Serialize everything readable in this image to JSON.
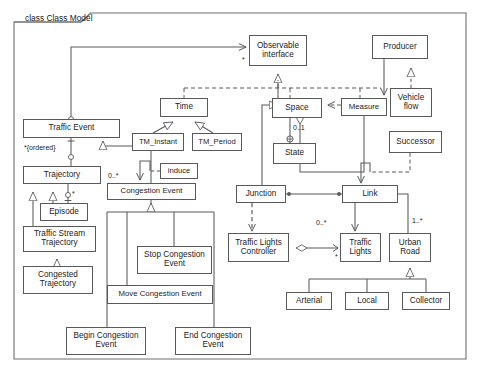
{
  "diagram": {
    "kind": "uml-class-diagram",
    "frame_label": "class Class Model",
    "canvas": {
      "width": 481,
      "height": 378
    },
    "colors": {
      "line": "#58595b",
      "text": "#1b1b1b",
      "background": "#ffffff"
    }
  },
  "classes": [
    {
      "id": "observable_interface",
      "label": "Observable\ninterface",
      "x": 249,
      "y": 35,
      "w": 58,
      "h": 31
    },
    {
      "id": "producer",
      "label": "Producer",
      "x": 372,
      "y": 35,
      "w": 56,
      "h": 24
    },
    {
      "id": "time",
      "label": "Time",
      "x": 160,
      "y": 98,
      "w": 48,
      "h": 19
    },
    {
      "id": "space",
      "label": "Space",
      "x": 272,
      "y": 98,
      "w": 50,
      "h": 20
    },
    {
      "id": "measure",
      "label": "Measure",
      "x": 341,
      "y": 98,
      "w": 46,
      "h": 18
    },
    {
      "id": "vehicle_flow",
      "label": "Vehicle\nflow",
      "x": 390,
      "y": 88,
      "w": 42,
      "h": 29
    },
    {
      "id": "traffic_event",
      "label": "Traffic Event",
      "x": 23,
      "y": 119,
      "w": 97,
      "h": 19
    },
    {
      "id": "tm_instant",
      "label": "TM_Instant",
      "x": 132,
      "y": 133,
      "w": 52,
      "h": 18
    },
    {
      "id": "tm_period",
      "label": "TM_Period",
      "x": 192,
      "y": 133,
      "w": 50,
      "h": 18
    },
    {
      "id": "successor",
      "label": "Successor",
      "x": 389,
      "y": 131,
      "w": 53,
      "h": 22
    },
    {
      "id": "state",
      "label": "State",
      "x": 273,
      "y": 143,
      "w": 43,
      "h": 21
    },
    {
      "id": "induce",
      "label": "induce",
      "x": 160,
      "y": 163,
      "w": 38,
      "h": 16
    },
    {
      "id": "trajectory",
      "label": "Trajectory",
      "x": 23,
      "y": 166,
      "w": 78,
      "h": 18
    },
    {
      "id": "congestion_event",
      "label": "Congestion Event",
      "x": 107,
      "y": 183,
      "w": 89,
      "h": 17
    },
    {
      "id": "junction",
      "label": "Junction",
      "x": 236,
      "y": 185,
      "w": 50,
      "h": 18
    },
    {
      "id": "link",
      "label": "Link",
      "x": 342,
      "y": 185,
      "w": 56,
      "h": 18
    },
    {
      "id": "episode",
      "label": "Episode",
      "x": 40,
      "y": 203,
      "w": 48,
      "h": 18
    },
    {
      "id": "traffic_stream_traj",
      "label": "Traffic Stream\nTrajectory",
      "x": 23,
      "y": 226,
      "w": 73,
      "h": 26
    },
    {
      "id": "traffic_lights_ctrl",
      "label": "Traffic Lights\nController",
      "x": 228,
      "y": 233,
      "w": 61,
      "h": 29
    },
    {
      "id": "traffic_lights",
      "label": "Traffic\nLights",
      "x": 340,
      "y": 233,
      "w": 41,
      "h": 29
    },
    {
      "id": "urban_road",
      "label": "Urban\nRoad",
      "x": 389,
      "y": 233,
      "w": 42,
      "h": 29
    },
    {
      "id": "stop_congestion",
      "label": "Stop Congestion\nEvent",
      "x": 137,
      "y": 246,
      "w": 75,
      "h": 28
    },
    {
      "id": "congested_traj",
      "label": "Congested\nTrajectory",
      "x": 23,
      "y": 266,
      "w": 70,
      "h": 28
    },
    {
      "id": "move_congestion",
      "label": "Move Congestion Event",
      "x": 107,
      "y": 285,
      "w": 106,
      "h": 19
    },
    {
      "id": "arterial",
      "label": "Arterial",
      "x": 286,
      "y": 292,
      "w": 46,
      "h": 18
    },
    {
      "id": "local",
      "label": "Local",
      "x": 345,
      "y": 292,
      "w": 44,
      "h": 18
    },
    {
      "id": "collector",
      "label": "Collector",
      "x": 402,
      "y": 292,
      "w": 48,
      "h": 18
    },
    {
      "id": "begin_congestion",
      "label": "Begin Congestion\nEvent",
      "x": 66,
      "y": 327,
      "w": 80,
      "h": 28
    },
    {
      "id": "end_congestion",
      "label": "End Congestion\nEvent",
      "x": 175,
      "y": 327,
      "w": 76,
      "h": 28
    }
  ],
  "multiplicities": [
    {
      "id": "m_observable_star",
      "label": "*",
      "x": 242,
      "y": 56
    },
    {
      "id": "m_state_01",
      "label": "0..1",
      "x": 291,
      "y": 125
    },
    {
      "id": "m_ordered",
      "label": "*{ordered}",
      "x": 24,
      "y": 145
    },
    {
      "id": "m_congestion_0n",
      "label": "0..*",
      "x": 108,
      "y": 173
    },
    {
      "id": "m_episode_star",
      "label": "*",
      "x": 66,
      "y": 192
    },
    {
      "id": "m_traffic_lights",
      "label": "0..*",
      "x": 316,
      "y": 220
    },
    {
      "id": "m_urban_road",
      "label": "1..*",
      "x": 412,
      "y": 218
    },
    {
      "id": "m_tlc_star",
      "label": "*",
      "x": 335,
      "y": 256
    }
  ],
  "relationships": [
    {
      "from": "traffic_event",
      "to": "observable_interface",
      "type": "association-directed"
    },
    {
      "from": "space",
      "to": "observable_interface",
      "type": "generalization"
    },
    {
      "from": "time",
      "to": "observable_interface",
      "type": "dependency"
    },
    {
      "from": "measure",
      "to": "observable_interface",
      "type": "dependency"
    },
    {
      "from": "tm_instant",
      "to": "time",
      "type": "generalization"
    },
    {
      "from": "tm_period",
      "to": "time",
      "type": "generalization"
    },
    {
      "from": "measure",
      "to": "space",
      "type": "dependency"
    },
    {
      "from": "producer",
      "to": "measure",
      "type": "association-directed"
    },
    {
      "from": "vehicle_flow",
      "to": "producer",
      "type": "realization"
    },
    {
      "from": "space",
      "to": "state",
      "type": "composition"
    },
    {
      "from": "measure",
      "to": "space",
      "type": "aggregation"
    },
    {
      "from": "successor",
      "to": "link",
      "type": "dependency"
    },
    {
      "from": "trajectory",
      "to": "traffic_event",
      "type": "aggregation"
    },
    {
      "from": "congestion_event",
      "to": "traffic_event",
      "type": "generalization"
    },
    {
      "from": "episode",
      "to": "trajectory",
      "type": "aggregation"
    },
    {
      "from": "traffic_stream_traj",
      "to": "trajectory",
      "type": "generalization"
    },
    {
      "from": "episode",
      "to": "trajectory",
      "type": "generalization"
    },
    {
      "from": "congested_traj",
      "to": "traffic_stream_traj",
      "type": "generalization"
    },
    {
      "from": "induce",
      "to": "congestion_event",
      "type": "dependency"
    },
    {
      "from": "stop_congestion",
      "to": "congestion_event",
      "type": "generalization"
    },
    {
      "from": "move_congestion",
      "to": "congestion_event",
      "type": "generalization"
    },
    {
      "from": "begin_congestion",
      "to": "congestion_event",
      "type": "generalization"
    },
    {
      "from": "end_congestion",
      "to": "congestion_event",
      "type": "generalization"
    },
    {
      "from": "junction",
      "to": "space",
      "type": "generalization"
    },
    {
      "from": "junction",
      "to": "link",
      "type": "association"
    },
    {
      "from": "junction",
      "to": "traffic_lights_ctrl",
      "type": "dependency"
    },
    {
      "from": "link",
      "to": "traffic_lights",
      "type": "association-directed"
    },
    {
      "from": "link",
      "to": "urban_road",
      "type": "association"
    },
    {
      "from": "traffic_lights_ctrl",
      "to": "traffic_lights",
      "type": "aggregation"
    },
    {
      "from": "arterial",
      "to": "urban_road",
      "type": "generalization"
    },
    {
      "from": "local",
      "to": "urban_road",
      "type": "generalization"
    },
    {
      "from": "collector",
      "to": "urban_road",
      "type": "generalization"
    }
  ]
}
